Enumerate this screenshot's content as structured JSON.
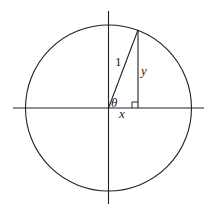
{
  "diagram": {
    "labels": {
      "hypotenuse": "1",
      "opposite": "y",
      "adjacent": "x",
      "angle": "θ"
    },
    "colors": {
      "stroke": "#222222",
      "background": "#ffffff"
    }
  }
}
